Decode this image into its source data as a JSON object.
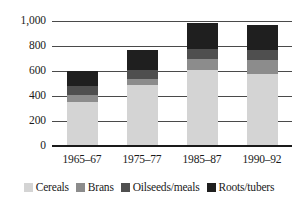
{
  "chart_data": {
    "type": "bar",
    "subtype": "stacked-bar",
    "title": "",
    "xlabel": "",
    "ylabel": "",
    "categories": [
      "1965–67",
      "1975–77",
      "1985–87",
      "1990–92"
    ],
    "series": [
      {
        "name": "Cereals",
        "values": [
          355,
          485,
          610,
          580
        ],
        "color": "#d4d4d4"
      },
      {
        "name": "Brans",
        "values": [
          55,
          55,
          90,
          105
        ],
        "color": "#8c8c8c"
      },
      {
        "name": "Oilseeds/meals",
        "values": [
          70,
          65,
          80,
          85
        ],
        "color": "#4f4f4f"
      },
      {
        "name": "Roots/tubers",
        "values": [
          120,
          160,
          205,
          195
        ],
        "color": "#1f1f1f"
      }
    ],
    "totals": [
      600,
      765,
      985,
      965
    ],
    "ylim": [
      0,
      1000
    ],
    "yticks": [
      0,
      200,
      400,
      600,
      800,
      1000
    ],
    "ytick_labels": [
      "0",
      "200",
      "400",
      "600",
      "800",
      "1,000"
    ],
    "grid": true,
    "legend_position": "bottom"
  },
  "legend": {
    "items": [
      {
        "label": "Cereals",
        "swatch": "legend-swatch-cereals"
      },
      {
        "label": "Brans",
        "swatch": "legend-swatch-brans"
      },
      {
        "label": "Oilseeds/meals",
        "swatch": "legend-swatch-oilseeds-meals"
      },
      {
        "label": "Roots/tubers",
        "swatch": "legend-swatch-roots-tubers"
      }
    ]
  }
}
